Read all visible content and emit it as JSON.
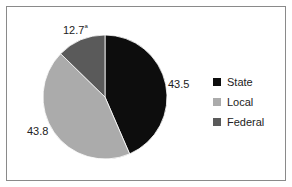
{
  "chart_data": {
    "type": "pie",
    "title": "",
    "categories": [
      "State",
      "Local",
      "Federal"
    ],
    "values": [
      43.5,
      43.8,
      12.7
    ],
    "colors": [
      "#0d0d0d",
      "#ababab",
      "#5a5a5a"
    ],
    "data_labels": [
      "43.5",
      "43.8",
      "12.7"
    ],
    "annotations": [
      {
        "label": "12.7",
        "superscript": "a"
      }
    ],
    "legend": {
      "position": "right",
      "entries": [
        "State",
        "Local",
        "Federal"
      ]
    },
    "start_angle_deg": 0,
    "direction": "clockwise"
  },
  "labels": {
    "state": "43.5",
    "local": "43.8",
    "federal": "12.7",
    "federal_note": "a"
  },
  "legend": {
    "items": [
      {
        "label": "State",
        "color": "#0d0d0d"
      },
      {
        "label": "Local",
        "color": "#ababab"
      },
      {
        "label": "Federal",
        "color": "#5a5a5a"
      }
    ]
  }
}
